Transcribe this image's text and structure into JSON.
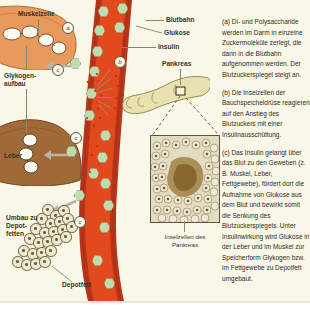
{
  "figure": {
    "title_hidden": "Regulation des Blutzuckerspiegels durch Insulin",
    "background_color": "#f9f7e8",
    "accent_colors": {
      "blood_vessel_lumen": "#e24a1e",
      "blood_vessel_wall": "#b8341a",
      "glucose": "#bedcae",
      "muscle_cell": "#e8995c",
      "liver": "#a06a38",
      "pancreas": "#e8e2b0",
      "fat": "#f0e9cf"
    }
  },
  "labels": {
    "muskelzelle": "Muskelzelle",
    "glykogen_line1": "Glykogen-",
    "glykogen_line2": "aufbau",
    "leber": "Leber",
    "umbau_line1": "Umbau zu",
    "umbau_line2": "Depot-",
    "umbau_line3": "fetten",
    "depotfett": "Depotfett",
    "blutbahn": "Blutbahn",
    "glukose": "Glukose",
    "insulin": "Insulin",
    "pankreas": "Pankreas"
  },
  "steps": {
    "a": "a",
    "b": "b",
    "c1": "c",
    "c2": "c",
    "c3": "c"
  },
  "inset_caption": {
    "line1": "Inselzellen des",
    "line2": "Pankreas"
  },
  "text_panel": {
    "paragraphs": [
      "(a) Di- und Polysaccharide werden im Darm in einzelne Zuckermoleküle zerlegt, die dann in die Blutbahn aufgenommen werden. Der Blutzuckerspiegel steigt an.",
      "(b) Die Inselzellen der Bauchspeicheldrüse reagieren auf den Anstieg des Blutzuckers mit einer Insulinausschüttung.",
      "(c) Das Insulin gelangt über das Blut zu den Geweben (z. B. Muskel, Leber, Fettgewebe), fördert dort die Aufnahme von Glukose aus dem Blut und bewirkt somit die Senkung des Blutzuckerspiegels. Unter Insulinwirkung wird Glukose in der Leber und im Muskel zur Speicherform Glykogen bzw. im Fettgewebe zu Depotfett umgebaut."
    ]
  }
}
